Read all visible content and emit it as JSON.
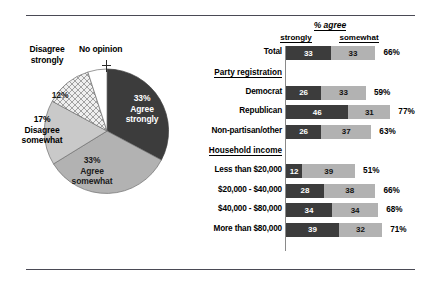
{
  "chart_data": [
    {
      "type": "pie",
      "title": "",
      "categories": [
        "Agree strongly",
        "Agree somewhat",
        "Disagree somewhat",
        "Disagree strongly",
        "No opinion"
      ],
      "values": [
        33,
        33,
        17,
        12,
        5
      ],
      "labels": [
        {
          "name": "Agree strongly",
          "value": 33,
          "text": "33%\nAgree\nstrongly",
          "fill": "#3c3c3c"
        },
        {
          "name": "Agree somewhat",
          "value": 33,
          "text": "33%\nAgree\nsomewhat",
          "fill": "#b2b2b2"
        },
        {
          "name": "Disagree somewhat",
          "value": 17,
          "text": "17%\nDisagree\nsomewhat",
          "fill": "#c9c9c9"
        },
        {
          "name": "Disagree strongly",
          "value": 12,
          "text": "12%\nDisagree\nstrongly",
          "fill": "#e3e3e3"
        },
        {
          "name": "No opinion",
          "value": 5,
          "text": "No opinion",
          "fill": "#ffffff"
        }
      ],
      "legend": "inside-slices"
    },
    {
      "type": "bar",
      "orientation": "horizontal",
      "stacked": true,
      "title": "% agree",
      "series": [
        {
          "name": "strongly"
        },
        {
          "name": "somewhat"
        }
      ],
      "xlabel": "",
      "ylabel": "",
      "grid": false,
      "rows": [
        {
          "kind": "bar",
          "label": "Total",
          "strongly": 33,
          "somewhat": 33,
          "total": "66%"
        },
        {
          "kind": "header",
          "label": "Party registration"
        },
        {
          "kind": "bar",
          "label": "Democrat",
          "strongly": 26,
          "somewhat": 33,
          "total": "59%"
        },
        {
          "kind": "bar",
          "label": "Republican",
          "strongly": 46,
          "somewhat": 31,
          "total": "77%"
        },
        {
          "kind": "bar",
          "label": "Non-partisan/other",
          "strongly": 26,
          "somewhat": 37,
          "total": "63%"
        },
        {
          "kind": "header",
          "label": "Household income"
        },
        {
          "kind": "bar",
          "label": "Less than $20,000",
          "strongly": 12,
          "somewhat": 39,
          "total": "51%"
        },
        {
          "kind": "bar",
          "label": "$20,000 - $40,000",
          "strongly": 28,
          "somewhat": 38,
          "total": "66%"
        },
        {
          "kind": "bar",
          "label": "$40,000 - $80,000",
          "strongly": 34,
          "somewhat": 34,
          "total": "68%"
        },
        {
          "kind": "bar",
          "label": "More than $80,000",
          "strongly": 39,
          "somewhat": 32,
          "total": "71%"
        }
      ]
    }
  ],
  "pie": {
    "disagree_strongly_label": "Disagree\nstrongly",
    "disagree_strongly_l1": "Disagree",
    "disagree_strongly_l2": "strongly",
    "no_opinion_label": "No opinion",
    "pct12": "12%",
    "disagree_somewhat_l0": "17%",
    "disagree_somewhat_l1": "Disagree",
    "disagree_somewhat_l2": "somewhat",
    "agree_strongly_l0": "33%",
    "agree_strongly_l1": "Agree",
    "agree_strongly_l2": "strongly",
    "agree_somewhat_l0": "33%",
    "agree_somewhat_l1": "Agree",
    "agree_somewhat_l2": "somewhat"
  },
  "bars_header": {
    "title": "% agree",
    "col_strongly": "strongly",
    "col_somewhat": "somewhat"
  },
  "colors": {
    "strong_fill": "#3c3c3c",
    "somewhat_fill": "#b2b2b2",
    "rule": "#4a4a55",
    "axis": "#8a8a8a"
  }
}
